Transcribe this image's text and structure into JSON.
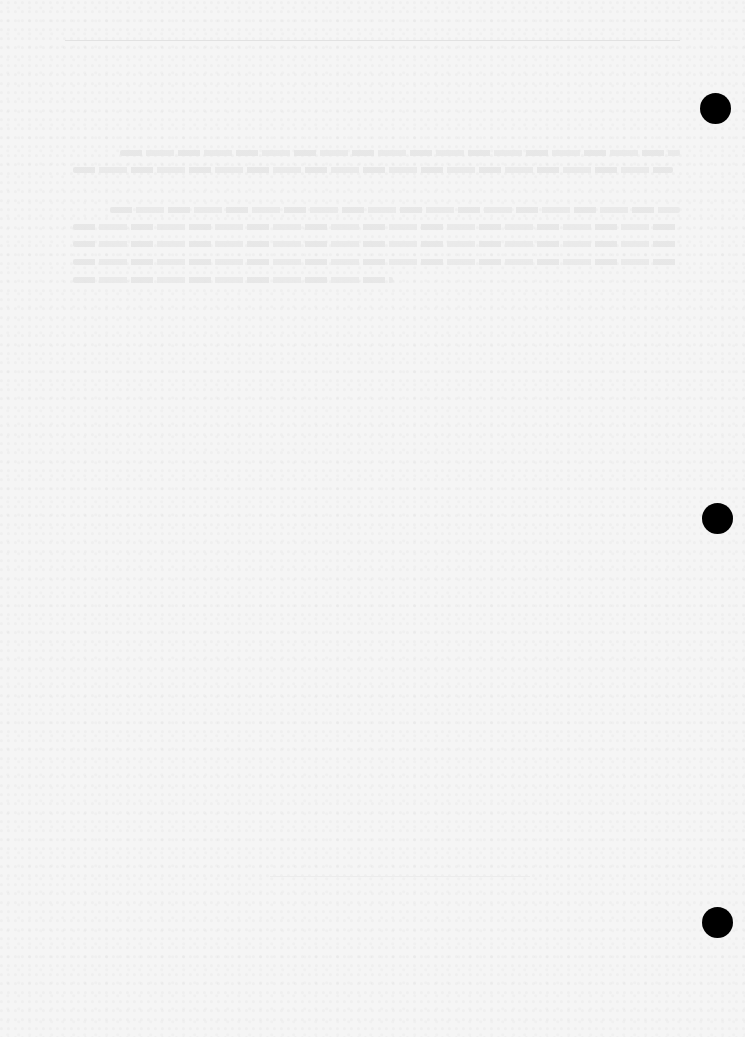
{
  "document": {
    "legibility": "text too faded to read",
    "top_rule": {
      "x": 65,
      "y": 40,
      "width": 615
    },
    "bottom_rule": {
      "x": 270,
      "y": 876,
      "width": 260
    },
    "paragraphs": [
      {
        "lines": [
          {
            "x": 120,
            "y": 153,
            "width": 560
          },
          {
            "x": 73,
            "y": 170,
            "width": 600
          }
        ]
      },
      {
        "lines": [
          {
            "x": 110,
            "y": 210,
            "width": 570
          },
          {
            "x": 73,
            "y": 227,
            "width": 605
          },
          {
            "x": 73,
            "y": 244,
            "width": 605
          },
          {
            "x": 73,
            "y": 262,
            "width": 605
          },
          {
            "x": 73,
            "y": 280,
            "width": 320
          }
        ]
      }
    ],
    "punch_holes": [
      {
        "cx": 715,
        "cy": 108
      },
      {
        "cx": 717,
        "cy": 518
      },
      {
        "cx": 717,
        "cy": 922
      }
    ]
  }
}
